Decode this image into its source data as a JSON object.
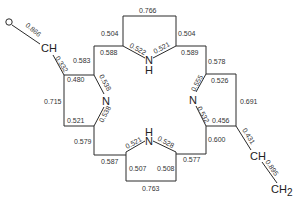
{
  "diagram": {
    "type": "molecular-structure",
    "atoms": {
      "o": "O",
      "ch_left": "CH",
      "ch_right": "CH",
      "ch2": "CH",
      "ch2_sub": "2",
      "n_top": "N",
      "h_top": "H",
      "n_bottom": "N",
      "h_bottom": "H",
      "n_left": "N",
      "n_right": "N"
    },
    "bonds": {
      "o_ch": "0.866",
      "ch_ring_left": "0.332",
      "left_top_inner": "0.480",
      "left_outer": "0.715",
      "left_bottom_inner": "0.521",
      "left_n_top": "0.538",
      "left_n_bottom": "0.538",
      "left_meso_top": "0.583",
      "left_meso_bottom": "0.579",
      "top_meso_left": "0.588",
      "top_meso_right": "0.589",
      "top_ring_left": "0.504",
      "top_ring_right": "0.504",
      "top_ring_top": "0.766",
      "top_n_left": "0.522",
      "top_n_right": "0.521",
      "right_meso_top": "0.578",
      "right_meso_bottom": "0.600",
      "right_top_inner": "0.526",
      "right_outer": "0.691",
      "right_bottom_inner": "0.456",
      "right_n_top": "0.555",
      "right_n_bottom": "0.532",
      "ring_ch_right": "0.431",
      "ch_ch2": "0.895",
      "bottom_meso_left": "0.587",
      "bottom_meso_right": "0.577",
      "bottom_n_left": "0.521",
      "bottom_n_right": "0.528",
      "bottom_ring_left": "0.507",
      "bottom_ring_right": "0.508",
      "bottom_ring_bottom": "0.763"
    }
  }
}
